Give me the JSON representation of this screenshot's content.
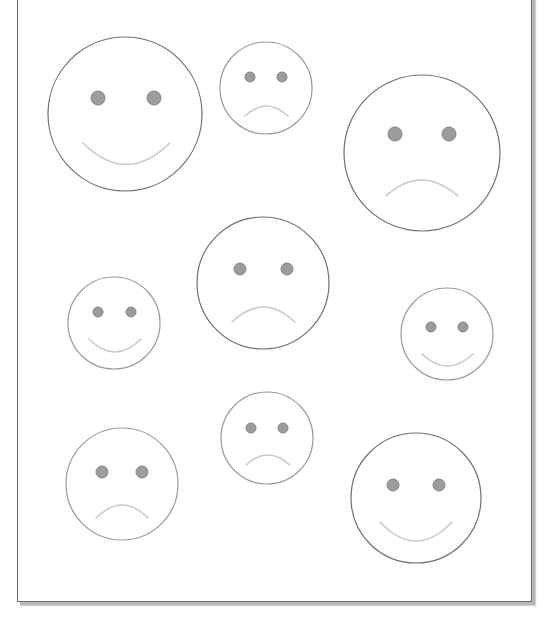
{
  "page": {
    "header_text": "",
    "colors": {
      "outline_dark": "#707070",
      "outline_light": "#9a9a9a",
      "eye_fill": "#9c9c9c",
      "eye_stroke": "#858585",
      "mouth": "#c8c8c8",
      "border": "#6a6a6a",
      "shadow": "#b8b8b8"
    }
  },
  "faces": [
    {
      "id": "face-1",
      "expression": "happy",
      "cx": 125,
      "cy": 114,
      "r": 77,
      "eye_r": 7,
      "eyes": [
        [
          98,
          98
        ],
        [
          154,
          98
        ]
      ],
      "mouth": {
        "x1": 83,
        "y1": 143,
        "cx": 126,
        "cy": 186,
        "x2": 170,
        "y2": 143
      },
      "outline": "dark"
    },
    {
      "id": "face-2",
      "expression": "sad",
      "cx": 266,
      "cy": 88,
      "r": 46,
      "eye_r": 5,
      "eyes": [
        [
          250,
          77
        ],
        [
          282,
          77
        ]
      ],
      "mouth": {
        "x1": 245,
        "y1": 116,
        "cx": 266,
        "cy": 96,
        "x2": 288,
        "y2": 116
      },
      "outline": "light"
    },
    {
      "id": "face-3",
      "expression": "sad",
      "cx": 422,
      "cy": 153,
      "r": 78,
      "eye_r": 7,
      "eyes": [
        [
          395,
          134
        ],
        [
          449,
          134
        ]
      ],
      "mouth": {
        "x1": 386,
        "y1": 196,
        "cx": 421,
        "cy": 164,
        "x2": 458,
        "y2": 196
      },
      "outline": "dark"
    },
    {
      "id": "face-4",
      "expression": "sad",
      "cx": 263,
      "cy": 283,
      "r": 66,
      "eye_r": 6,
      "eyes": [
        [
          240,
          269
        ],
        [
          287,
          269
        ]
      ],
      "mouth": {
        "x1": 232,
        "y1": 322,
        "cx": 264,
        "cy": 292,
        "x2": 295,
        "y2": 322
      },
      "outline": "dark"
    },
    {
      "id": "face-5",
      "expression": "happy",
      "cx": 114,
      "cy": 323,
      "r": 46,
      "eye_r": 5,
      "eyes": [
        [
          98,
          312
        ],
        [
          131,
          312
        ]
      ],
      "mouth": {
        "x1": 89,
        "y1": 339,
        "cx": 115,
        "cy": 365,
        "x2": 141,
        "y2": 339
      },
      "outline": "light"
    },
    {
      "id": "face-6",
      "expression": "happy",
      "cx": 447,
      "cy": 334,
      "r": 46,
      "eye_r": 5,
      "eyes": [
        [
          431,
          327
        ],
        [
          463,
          327
        ]
      ],
      "mouth": {
        "x1": 422,
        "y1": 354,
        "cx": 447,
        "cy": 378,
        "x2": 473,
        "y2": 354
      },
      "outline": "light"
    },
    {
      "id": "face-7",
      "expression": "sad",
      "cx": 267,
      "cy": 438,
      "r": 46,
      "eye_r": 5,
      "eyes": [
        [
          251,
          428
        ],
        [
          283,
          428
        ]
      ],
      "mouth": {
        "x1": 246,
        "y1": 465,
        "cx": 268,
        "cy": 445,
        "x2": 290,
        "y2": 465
      },
      "outline": "light"
    },
    {
      "id": "face-8",
      "expression": "sad",
      "cx": 122,
      "cy": 484,
      "r": 56,
      "eye_r": 6,
      "eyes": [
        [
          102,
          472
        ],
        [
          142,
          472
        ]
      ],
      "mouth": {
        "x1": 96,
        "y1": 518,
        "cx": 122,
        "cy": 492,
        "x2": 148,
        "y2": 518
      },
      "outline": "light"
    },
    {
      "id": "face-9",
      "expression": "happy",
      "cx": 416,
      "cy": 498,
      "r": 65,
      "eye_r": 6,
      "eyes": [
        [
          393,
          485
        ],
        [
          439,
          485
        ]
      ],
      "mouth": {
        "x1": 380,
        "y1": 522,
        "cx": 416,
        "cy": 560,
        "x2": 452,
        "y2": 522
      },
      "outline": "dark"
    }
  ]
}
